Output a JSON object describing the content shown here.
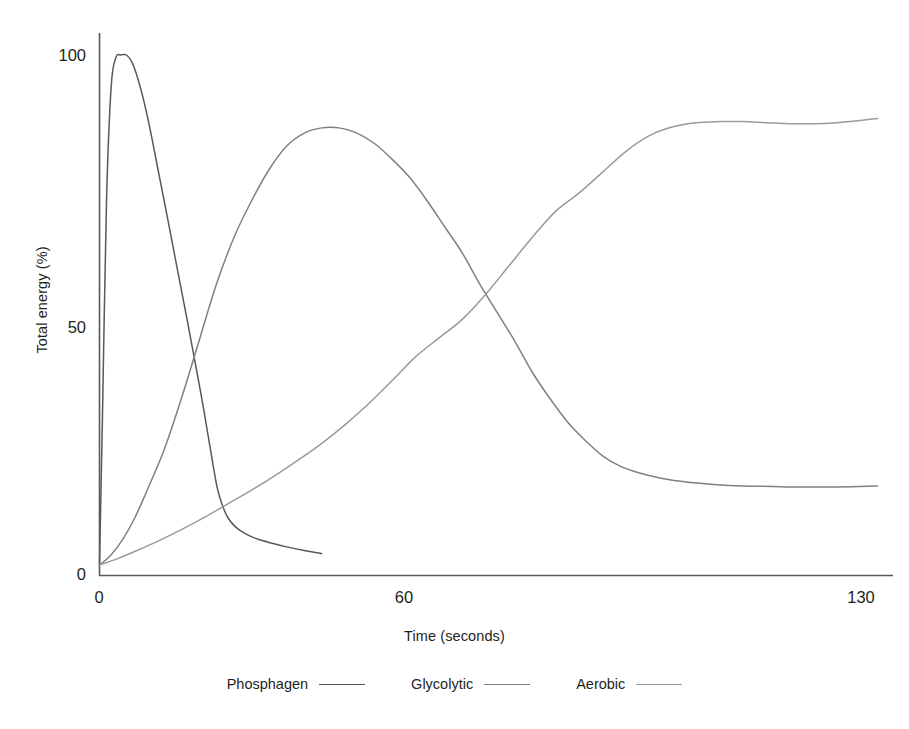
{
  "chart_data": {
    "type": "line",
    "title": "",
    "subtitle": "",
    "xlabel": "Time (seconds)",
    "ylabel": "Total energy (%)",
    "xlim": [
      0,
      133
    ],
    "ylim": [
      0,
      103
    ],
    "xticks": [
      0,
      60,
      130
    ],
    "xtick_labels": [
      "0",
      "60",
      "130"
    ],
    "yticks": [
      0,
      50,
      100
    ],
    "ytick_labels": [
      "0",
      "50",
      "100"
    ],
    "grid": false,
    "legend_position": "below-axes",
    "annotations": [],
    "series": [
      {
        "name": "Phosphagen",
        "color": "#595959",
        "x": [
          0,
          0.5,
          1.2,
          2.0,
          2.8,
          3.6,
          4.6,
          5.6,
          6.4,
          7.4,
          8.6,
          10.0,
          11.4,
          12.6,
          13.8,
          15.0,
          16.0,
          17.0,
          17.8,
          18.4,
          19.0,
          19.6,
          20.2,
          21.0,
          22.0,
          23.4,
          25.0,
          27.0,
          29.5,
          32.0,
          35.0,
          38.0
        ],
        "y": [
          2,
          30,
          72,
          94,
          99.5,
          100,
          100,
          98.5,
          96,
          92,
          86,
          78,
          70,
          63,
          56,
          49,
          43,
          37,
          32,
          28,
          24,
          20,
          16.5,
          13.5,
          11,
          9.2,
          8.0,
          7.0,
          6.2,
          5.5,
          4.8,
          4.2
        ]
      },
      {
        "name": "Glycolytic",
        "color": "#808080",
        "x": [
          0,
          2,
          4,
          6,
          8,
          11,
          14,
          17,
          20,
          23,
          26,
          29,
          32,
          35,
          38,
          41,
          44,
          47,
          50,
          53,
          56,
          59,
          62,
          65,
          68,
          71,
          74,
          77,
          80,
          83,
          86,
          89,
          92,
          96,
          100,
          105,
          110,
          115,
          120,
          125,
          130,
          133
        ],
        "y": [
          2,
          4,
          7,
          11,
          16,
          24,
          34,
          45,
          56,
          65,
          72,
          78,
          82.5,
          85,
          86,
          86,
          85,
          83,
          80,
          76.5,
          72,
          67,
          62,
          56,
          50.5,
          45,
          39,
          34,
          29.5,
          26,
          23,
          21,
          19.8,
          18.7,
          18.0,
          17.5,
          17.2,
          17.1,
          17.0,
          17.0,
          17.1,
          17.2
        ]
      },
      {
        "name": "Aerobic",
        "color": "#9a9a9a",
        "x": [
          0,
          3,
          6,
          10,
          14,
          18,
          22,
          26,
          30,
          34,
          38,
          42,
          46,
          50,
          54,
          58,
          62,
          66,
          70,
          74,
          78,
          82,
          86,
          90,
          94,
          98,
          102,
          106,
          110,
          114,
          118,
          122,
          126,
          130,
          133
        ],
        "y": [
          2,
          3.2,
          4.6,
          6.6,
          8.8,
          11.2,
          13.8,
          16.4,
          19.2,
          22.2,
          25.4,
          29.0,
          33.0,
          37.4,
          42.0,
          45.6,
          49.2,
          54.0,
          59.5,
          65.0,
          70.0,
          73.5,
          77.5,
          81.5,
          84.5,
          86.2,
          87.0,
          87.2,
          87.2,
          87.0,
          86.8,
          86.8,
          87.0,
          87.4,
          87.8
        ]
      }
    ]
  },
  "axes": {
    "y_title": "Total energy (%)",
    "x_title": "Time (seconds)",
    "y_tick_100": "100",
    "y_tick_50": "50",
    "y_tick_0": "0",
    "x_tick_0": "0",
    "x_tick_60": "60",
    "x_tick_130": "130",
    "axis_color": "#58595b"
  },
  "legend": {
    "entries": [
      {
        "label": "Phosphagen",
        "color": "#595959"
      },
      {
        "label": "Glycolytic",
        "color": "#808080"
      },
      {
        "label": "Aerobic",
        "color": "#9a9a9a"
      }
    ]
  }
}
